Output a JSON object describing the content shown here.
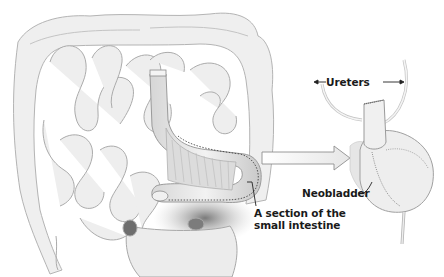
{
  "figure": {
    "type": "anatomical-illustration",
    "colors": {
      "background": "#ffffff",
      "tissue_fill": "#ececec",
      "tissue_stroke": "#b0b0b0",
      "shadow": "#8c8c8c",
      "label_text": "#1a1a1a",
      "dotted_outline": "#333333"
    }
  },
  "labels": {
    "ureters": "Ureters",
    "neobladder": "Neobladder",
    "section_line1": "A section of the",
    "section_line2": "small intestine"
  },
  "arrow": {
    "direction": "right",
    "meaning": "transformation of intestine segment into neobladder"
  }
}
